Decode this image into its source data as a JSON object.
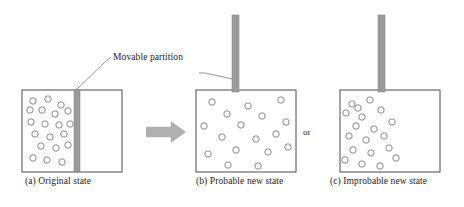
{
  "figure": {
    "callout": {
      "label": "Movable partition",
      "x": 113,
      "y": 52
    },
    "or_separator": {
      "label": "or",
      "x": 303,
      "y": 127
    },
    "colors": {
      "box_stroke": "#4a4a4a",
      "circle_stroke": "#8a8a8a",
      "partition_fill": "#9a9a9a",
      "partition_stroke": "#8a8a8a",
      "arrow_fill": "#b0b0b0",
      "leader_line": "#7a7a7a",
      "text": "#1a1a1a",
      "background": "#ffffff"
    },
    "panels": [
      {
        "id": "a",
        "caption": "(a) Original state",
        "caption_x": 25,
        "caption_y": 176,
        "box": {
          "x": 22,
          "y": 90,
          "w": 100,
          "h": 82
        },
        "partition": {
          "x": 74,
          "y": 90,
          "w": 6,
          "h": 82,
          "raised": false
        },
        "circle_radius": 3.2,
        "circles": [
          [
            33,
            101
          ],
          [
            48,
            99
          ],
          [
            61,
            105
          ],
          [
            42,
            110
          ],
          [
            55,
            114
          ],
          [
            68,
            111
          ],
          [
            31,
            122
          ],
          [
            45,
            124
          ],
          [
            59,
            125
          ],
          [
            35,
            134
          ],
          [
            50,
            137
          ],
          [
            64,
            134
          ],
          [
            41,
            146
          ],
          [
            56,
            148
          ],
          [
            68,
            145
          ],
          [
            33,
            158
          ],
          [
            47,
            160
          ],
          [
            62,
            162
          ],
          [
            30,
            110
          ],
          [
            70,
            124
          ]
        ]
      },
      {
        "id": "b",
        "caption": "(b) Probable new state",
        "caption_x": 196,
        "caption_y": 176,
        "box": {
          "x": 196,
          "y": 90,
          "w": 100,
          "h": 82
        },
        "partition": {
          "x": 232,
          "y": 15,
          "w": 7,
          "h": 77,
          "raised": true
        },
        "circle_radius": 3.2,
        "circles": [
          [
            212,
            102
          ],
          [
            248,
            106
          ],
          [
            281,
            100
          ],
          [
            227,
            114
          ],
          [
            262,
            116
          ],
          [
            204,
            126
          ],
          [
            241,
            125
          ],
          [
            286,
            122
          ],
          [
            222,
            137
          ],
          [
            256,
            139
          ],
          [
            276,
            134
          ],
          [
            236,
            150
          ],
          [
            268,
            152
          ],
          [
            208,
            154
          ],
          [
            228,
            165
          ],
          [
            258,
            166
          ],
          [
            288,
            147
          ]
        ]
      },
      {
        "id": "c",
        "caption": "(c) Improbable new state",
        "caption_x": 330,
        "caption_y": 176,
        "box": {
          "x": 340,
          "y": 90,
          "w": 100,
          "h": 82
        },
        "partition": {
          "x": 378,
          "y": 15,
          "w": 7,
          "h": 77,
          "raised": true
        },
        "circle_radius": 3.2,
        "circles": [
          [
            352,
            104
          ],
          [
            370,
            100
          ],
          [
            346,
            113
          ],
          [
            362,
            117
          ],
          [
            381,
            110
          ],
          [
            356,
            126
          ],
          [
            374,
            129
          ],
          [
            392,
            122
          ],
          [
            349,
            136
          ],
          [
            366,
            140
          ],
          [
            384,
            136
          ],
          [
            353,
            150
          ],
          [
            371,
            153
          ],
          [
            389,
            148
          ],
          [
            345,
            160
          ],
          [
            362,
            164
          ],
          [
            380,
            166
          ],
          [
            396,
            158
          ],
          [
            358,
            108
          ]
        ]
      }
    ],
    "arrow": {
      "x": 146,
      "y": 121,
      "w": 40,
      "h": 22
    },
    "leader_lines": [
      {
        "name": "left",
        "points": "75,91 105,62 111,57"
      },
      {
        "name": "right",
        "points": "232,79 205,73 199,73"
      }
    ]
  }
}
